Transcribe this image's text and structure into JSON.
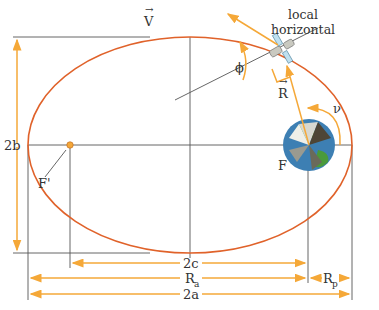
{
  "diagram": {
    "type": "orbital-ellipse",
    "labels": {
      "velocity": "V",
      "radius": "R",
      "flight_path_angle": "ϕ",
      "true_anomaly": "ν",
      "local_horizontal_line1": "local",
      "local_horizontal_line2": "horizontal",
      "minor_axis": "2b",
      "focus_empty": "F'",
      "focus_primary": "F",
      "focal_distance": "2c",
      "apoapsis_radius": "R",
      "apoapsis_sub": "a",
      "periapsis_radius": "R",
      "periapsis_sub": "p",
      "major_axis": "2a"
    },
    "colors": {
      "orbit": "#e0622a",
      "arrows": "#f5a838",
      "lines": "#555555",
      "text": "#333333"
    }
  }
}
